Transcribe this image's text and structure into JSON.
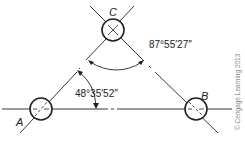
{
  "diagram": {
    "stations": [
      {
        "id": "A",
        "label": "A"
      },
      {
        "id": "B",
        "label": "B"
      },
      {
        "id": "C",
        "label": "C"
      }
    ],
    "angles": [
      {
        "at": "C",
        "between": [
          "A",
          "B"
        ],
        "value": "87°55′27″"
      },
      {
        "at": "A",
        "between": [
          "B",
          "C"
        ],
        "value": "48°35′52″"
      }
    ],
    "copyright": "© Cengage Learning 2013",
    "colors": {
      "line": "#222222",
      "text": "#222222",
      "watermark": "#888888"
    }
  }
}
